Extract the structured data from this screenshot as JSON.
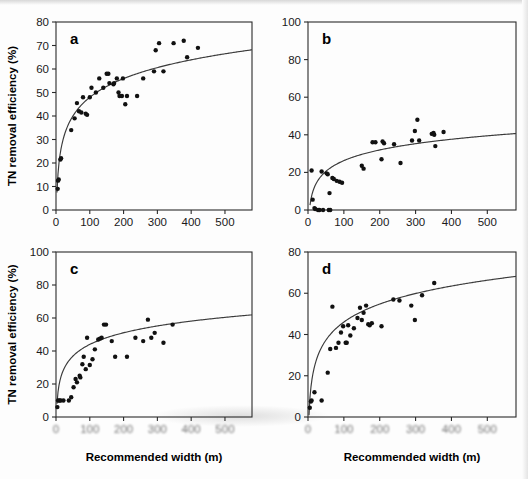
{
  "figure": {
    "panels": [
      {
        "label": "a",
        "ylabel": "TN removal efficiency (%)",
        "xlabel": "",
        "show_ylabel": true,
        "show_xlabel": false,
        "xlim": [
          0,
          580
        ],
        "ylim": [
          0,
          80
        ],
        "xticks": [
          0,
          100,
          200,
          300,
          400,
          500
        ],
        "yticks": [
          0,
          10,
          20,
          30,
          40,
          50,
          60,
          70,
          80
        ],
        "blur_xticks": false
      },
      {
        "label": "b",
        "ylabel": "",
        "xlabel": "",
        "show_ylabel": false,
        "show_xlabel": false,
        "xlim": [
          0,
          580
        ],
        "ylim": [
          0,
          100
        ],
        "xticks": [
          0,
          100,
          200,
          300,
          400,
          500
        ],
        "yticks": [
          0,
          20,
          40,
          60,
          80,
          100
        ],
        "blur_xticks": false
      },
      {
        "label": "c",
        "ylabel": "TN removal efficiency (%)",
        "xlabel": "Recommended width (m)",
        "show_ylabel": true,
        "show_xlabel": true,
        "xlim": [
          0,
          580
        ],
        "ylim": [
          0,
          100
        ],
        "xticks": [
          0,
          100,
          200,
          300,
          400,
          500
        ],
        "yticks": [
          0,
          20,
          40,
          60,
          80,
          100
        ],
        "blur_xticks": true
      },
      {
        "label": "d",
        "ylabel": "",
        "xlabel": "Recommended width (m)",
        "show_ylabel": false,
        "show_xlabel": true,
        "xlim": [
          0,
          580
        ],
        "ylim": [
          0,
          80
        ],
        "xticks": [
          0,
          100,
          200,
          300,
          400,
          500
        ],
        "yticks": [
          0,
          20,
          40,
          60,
          80
        ],
        "blur_xticks": true
      }
    ]
  },
  "chart_data": [
    {
      "type": "scatter",
      "panel": "a",
      "title": "",
      "xlabel": "Recommended width (m)",
      "ylabel": "TN removal efficiency (%)",
      "xlim": [
        0,
        580
      ],
      "ylim": [
        0,
        80
      ],
      "xticks": [
        0,
        100,
        200,
        300,
        400,
        500
      ],
      "yticks": [
        0,
        10,
        20,
        30,
        40,
        50,
        60,
        70,
        80
      ],
      "grid": false,
      "legend": "none",
      "series": [
        {
          "name": "observations",
          "marker": "filled-circle",
          "points": [
            [
              5,
              9
            ],
            [
              6,
              12.5
            ],
            [
              8,
              13
            ],
            [
              13,
              21.5
            ],
            [
              15,
              22
            ],
            [
              45,
              34
            ],
            [
              55,
              39
            ],
            [
              62,
              45.5
            ],
            [
              68,
              42
            ],
            [
              75,
              41.5
            ],
            [
              80,
              48
            ],
            [
              88,
              41
            ],
            [
              92,
              40.5
            ],
            [
              100,
              48
            ],
            [
              105,
              52
            ],
            [
              118,
              50
            ],
            [
              128,
              56
            ],
            [
              140,
              52
            ],
            [
              150,
              58
            ],
            [
              155,
              58
            ],
            [
              158,
              54
            ],
            [
              170,
              53.5
            ],
            [
              172,
              54
            ],
            [
              180,
              56
            ],
            [
              185,
              50
            ],
            [
              188,
              48.5
            ],
            [
              195,
              48.5
            ],
            [
              198,
              56
            ],
            [
              205,
              45
            ],
            [
              210,
              48.5
            ],
            [
              240,
              48.5
            ],
            [
              258,
              56
            ],
            [
              290,
              59
            ],
            [
              295,
              68
            ],
            [
              305,
              71
            ],
            [
              318,
              59
            ],
            [
              348,
              71
            ],
            [
              378,
              72
            ],
            [
              388,
              65
            ],
            [
              420,
              69
            ]
          ]
        }
      ],
      "fit_curve": {
        "form": "a*ln(x)+b",
        "a": 11.5,
        "b": -5.0,
        "description": "logarithmic regression line"
      }
    },
    {
      "type": "scatter",
      "panel": "b",
      "title": "",
      "xlabel": "Recommended width (m)",
      "ylabel": "TN removal efficiency (%)",
      "xlim": [
        0,
        580
      ],
      "ylim": [
        0,
        100
      ],
      "xticks": [
        0,
        100,
        200,
        300,
        400,
        500
      ],
      "yticks": [
        0,
        20,
        40,
        60,
        80,
        100
      ],
      "grid": false,
      "legend": "none",
      "series": [
        {
          "name": "observations",
          "marker": "filled-circle",
          "points": [
            [
              10,
              21
            ],
            [
              13,
              5.5
            ],
            [
              18,
              1
            ],
            [
              20,
              0.5
            ],
            [
              28,
              0
            ],
            [
              32,
              0
            ],
            [
              38,
              20.5
            ],
            [
              42,
              0
            ],
            [
              52,
              19.5
            ],
            [
              55,
              19
            ],
            [
              58,
              0
            ],
            [
              62,
              0
            ],
            [
              60,
              9
            ],
            [
              68,
              17
            ],
            [
              72,
              16.5
            ],
            [
              80,
              15.5
            ],
            [
              88,
              15
            ],
            [
              95,
              14.5
            ],
            [
              150,
              23.5
            ],
            [
              155,
              22
            ],
            [
              180,
              36
            ],
            [
              188,
              36
            ],
            [
              205,
              27
            ],
            [
              208,
              36.5
            ],
            [
              212,
              35.5
            ],
            [
              240,
              35
            ],
            [
              258,
              25
            ],
            [
              290,
              37
            ],
            [
              298,
              42
            ],
            [
              305,
              48
            ],
            [
              310,
              37
            ],
            [
              345,
              40.5
            ],
            [
              350,
              41
            ],
            [
              352,
              40
            ],
            [
              355,
              34
            ],
            [
              378,
              41.5
            ]
          ]
        }
      ],
      "fit_curve": {
        "form": "a*ln(x)+b",
        "a": 8.2,
        "b": -11.5,
        "description": "logarithmic regression line"
      }
    },
    {
      "type": "scatter",
      "panel": "c",
      "title": "",
      "xlabel": "Recommended width (m)",
      "ylabel": "TN removal efficiency (%)",
      "xlim": [
        0,
        580
      ],
      "ylim": [
        0,
        100
      ],
      "xticks": [
        0,
        100,
        200,
        300,
        400,
        500
      ],
      "yticks": [
        0,
        20,
        40,
        60,
        80,
        100
      ],
      "grid": false,
      "legend": "none",
      "series": [
        {
          "name": "observations",
          "marker": "filled-circle",
          "points": [
            [
              4,
              6
            ],
            [
              6,
              10
            ],
            [
              10,
              10
            ],
            [
              14,
              10
            ],
            [
              22,
              10
            ],
            [
              38,
              10
            ],
            [
              45,
              12
            ],
            [
              52,
              18
            ],
            [
              58,
              23
            ],
            [
              62,
              21
            ],
            [
              70,
              25
            ],
            [
              72,
              24
            ],
            [
              78,
              32
            ],
            [
              82,
              36.5
            ],
            [
              88,
              29
            ],
            [
              92,
              48
            ],
            [
              100,
              31.5
            ],
            [
              108,
              35
            ],
            [
              115,
              41
            ],
            [
              125,
              47
            ],
            [
              130,
              47.5
            ],
            [
              135,
              48
            ],
            [
              142,
              56
            ],
            [
              148,
              56
            ],
            [
              165,
              46
            ],
            [
              175,
              36.5
            ],
            [
              210,
              36.5
            ],
            [
              235,
              48
            ],
            [
              258,
              46
            ],
            [
              272,
              59
            ],
            [
              282,
              48
            ],
            [
              292,
              51
            ],
            [
              318,
              45
            ],
            [
              345,
              56
            ]
          ]
        }
      ],
      "fit_curve": {
        "form": "a*ln(x)+b",
        "a": 10.2,
        "b": -3.0,
        "description": "logarithmic regression line"
      }
    },
    {
      "type": "scatter",
      "panel": "d",
      "title": "",
      "xlabel": "Recommended width (m)",
      "ylabel": "TN removal efficiency (%)",
      "xlim": [
        0,
        580
      ],
      "ylim": [
        0,
        80
      ],
      "xticks": [
        0,
        100,
        200,
        300,
        400,
        500
      ],
      "yticks": [
        0,
        20,
        40,
        60,
        80
      ],
      "grid": false,
      "legend": "none",
      "series": [
        {
          "name": "observations",
          "marker": "filled-circle",
          "points": [
            [
              5,
              4.5
            ],
            [
              8,
              7.5
            ],
            [
              10,
              8
            ],
            [
              18,
              12
            ],
            [
              38,
              8
            ],
            [
              55,
              21.5
            ],
            [
              62,
              33
            ],
            [
              68,
              53.5
            ],
            [
              78,
              33.5
            ],
            [
              85,
              36
            ],
            [
              92,
              41
            ],
            [
              98,
              44
            ],
            [
              105,
              36
            ],
            [
              108,
              36
            ],
            [
              112,
              44.5
            ],
            [
              118,
              39.5
            ],
            [
              128,
              43
            ],
            [
              138,
              48
            ],
            [
              145,
              53
            ],
            [
              150,
              47
            ],
            [
              155,
              50.5
            ],
            [
              162,
              54
            ],
            [
              168,
              45
            ],
            [
              172,
              44.5
            ],
            [
              178,
              45.5
            ],
            [
              205,
              44
            ],
            [
              238,
              57
            ],
            [
              255,
              56.5
            ],
            [
              288,
              54
            ],
            [
              298,
              47
            ],
            [
              318,
              59
            ],
            [
              352,
              65
            ]
          ]
        }
      ],
      "fit_curve": {
        "form": "a*ln(x)+b",
        "a": 12.6,
        "b": -12.0,
        "description": "logarithmic regression line"
      }
    }
  ]
}
